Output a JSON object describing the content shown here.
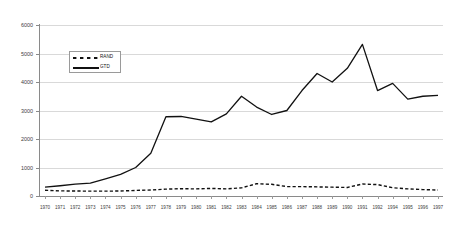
{
  "chart_data": {
    "type": "line",
    "title": "",
    "subtitle": "",
    "xlabel": "",
    "ylabel": "",
    "xlim": [
      1970,
      1997
    ],
    "ylim": [
      0,
      6000
    ],
    "grid": true,
    "grid_axis": "y",
    "legend_position": "upper-left-inside",
    "categories": [
      "1970",
      "1971",
      "1972",
      "1973",
      "1974",
      "1975",
      "1976",
      "1977",
      "1978",
      "1979",
      "1980",
      "1981",
      "1982",
      "1983",
      "1984",
      "1985",
      "1986",
      "1987",
      "1988",
      "1989",
      "1990",
      "1991",
      "1992",
      "1994",
      "1995",
      "1996",
      "1997"
    ],
    "yticks": [
      0,
      1000,
      2000,
      3000,
      4000,
      5000,
      6000
    ],
    "ytick_labels": [
      "0",
      "1000",
      "2000",
      "3000",
      "4000",
      "5000",
      "6000"
    ],
    "series": [
      {
        "name": "RAND",
        "style": "dashed",
        "color": "#111111",
        "values": [
          200,
          180,
          175,
          170,
          170,
          175,
          195,
          210,
          240,
          255,
          250,
          265,
          250,
          285,
          430,
          410,
          330,
          330,
          320,
          310,
          300,
          420,
          400,
          290,
          250,
          225,
          210
        ]
      },
      {
        "name": "GTD",
        "style": "solid",
        "color": "#111111",
        "values": [
          310,
          360,
          420,
          450,
          600,
          760,
          1000,
          1500,
          2780,
          2790,
          2700,
          2600,
          2880,
          3500,
          3120,
          2860,
          3000,
          3700,
          4300,
          4000,
          4480,
          5320,
          3700,
          3950,
          3400,
          3500,
          3530
        ]
      }
    ]
  },
  "legend": {
    "entries": [
      {
        "label": "RAND",
        "marker": "dashed-line"
      },
      {
        "label": "GTD",
        "marker": "solid-line"
      }
    ]
  }
}
